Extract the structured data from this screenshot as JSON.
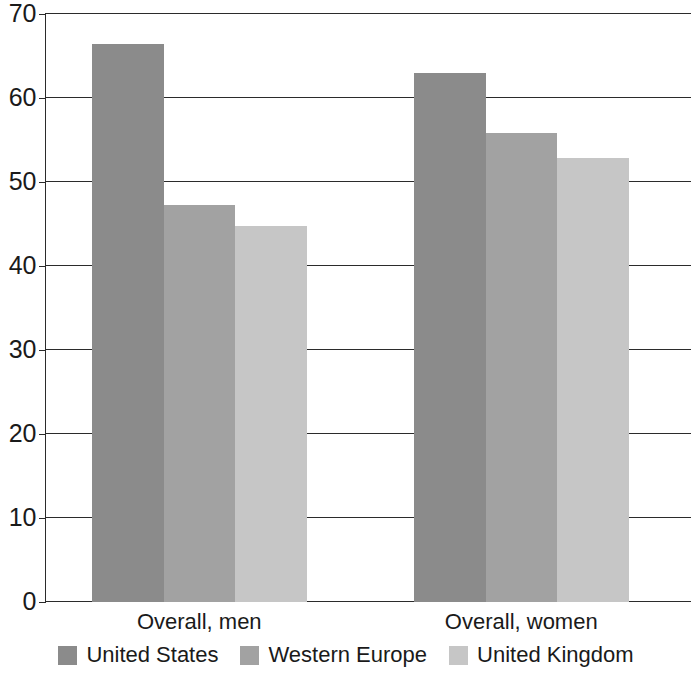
{
  "chart_data": {
    "type": "bar",
    "title": "",
    "subtitle": "",
    "xlabel": "",
    "ylabel": "",
    "categories": [
      "Overall, men",
      "Overall, women"
    ],
    "series": [
      {
        "name": "United States",
        "values": [
          66.4,
          63.0
        ],
        "color": "#8b8b8b"
      },
      {
        "name": "Western Europe",
        "values": [
          47.3,
          55.8
        ],
        "color": "#a2a2a2"
      },
      {
        "name": "United Kingdom",
        "values": [
          44.8,
          52.9
        ],
        "color": "#c6c6c6"
      }
    ],
    "ylim": [
      0,
      70
    ],
    "yticks": [
      0,
      10,
      20,
      30,
      40,
      50,
      60,
      70
    ],
    "ytick_labels": [
      "0",
      "10",
      "20",
      "30",
      "40",
      "50",
      "60",
      "70"
    ],
    "grid": true,
    "grid_axis": "y",
    "legend_position": "bottom",
    "annotations": []
  },
  "axis": {
    "y_labels": [
      "70",
      "60",
      "50",
      "40",
      "30",
      "20",
      "10",
      "0"
    ]
  },
  "legend": {
    "items": [
      {
        "label": "United States"
      },
      {
        "label": "Western Europe"
      },
      {
        "label": "United Kingdom"
      }
    ]
  }
}
